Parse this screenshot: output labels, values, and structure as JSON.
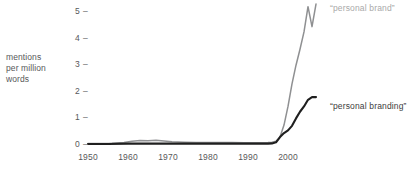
{
  "chart_data": {
    "type": "line",
    "title": "",
    "subtitle": "",
    "xlabel": "",
    "ylabel": "mentions per million words",
    "ylabel_lines": [
      "mentions",
      "per million",
      "words"
    ],
    "xlim": [
      1950,
      2008
    ],
    "ylim": [
      0,
      5.4
    ],
    "grid": false,
    "legend_position": "inline-right-of-line-ends",
    "yticks": [
      "0",
      "1",
      "2",
      "3",
      "4",
      "5"
    ],
    "ytick_values": [
      0,
      1,
      2,
      3,
      4,
      5
    ],
    "ytick_dash": "–",
    "xticks": [
      "1950",
      "1960",
      "1970",
      "1980",
      "1990",
      "2000"
    ],
    "xtick_values": [
      1950,
      1960,
      1970,
      1980,
      1990,
      2000
    ],
    "series": [
      {
        "name": "“personal brand”",
        "color": "#8f9092",
        "x": [
          1950,
          1953,
          1956,
          1959,
          1961,
          1963,
          1965,
          1967,
          1969,
          1971,
          1974,
          1977,
          1980,
          1983,
          1986,
          1989,
          1991,
          1993,
          1995,
          1996,
          1997,
          1998,
          1999,
          2000,
          2001,
          2002,
          2003,
          2004,
          2005,
          2006,
          2007
        ],
        "values": [
          0.06,
          0.06,
          0.07,
          0.09,
          0.14,
          0.17,
          0.16,
          0.18,
          0.15,
          0.12,
          0.1,
          0.09,
          0.09,
          0.09,
          0.09,
          0.08,
          0.08,
          0.08,
          0.09,
          0.1,
          0.14,
          0.3,
          0.75,
          1.45,
          2.3,
          3.0,
          3.6,
          4.25,
          5.2,
          4.45,
          5.3
        ]
      },
      {
        "name": "“personal branding”",
        "color": "#1f1f1f",
        "x": [
          1950,
          1955,
          1960,
          1965,
          1970,
          1975,
          1980,
          1985,
          1990,
          1993,
          1995,
          1996,
          1997,
          1998,
          1999,
          2000,
          2001,
          2002,
          2003,
          2004,
          2005,
          2006,
          2007
        ],
        "values": [
          0.04,
          0.04,
          0.05,
          0.05,
          0.05,
          0.05,
          0.05,
          0.05,
          0.05,
          0.05,
          0.05,
          0.06,
          0.1,
          0.3,
          0.45,
          0.55,
          0.72,
          1.0,
          1.25,
          1.45,
          1.7,
          1.8,
          1.8
        ]
      }
    ],
    "annotations": [
      {
        "text": "“personal brand”",
        "color": "#a9a9a9",
        "near_series": "personal brand"
      },
      {
        "text": "“personal branding”",
        "color": "#3c3c3c",
        "near_series": "personal branding"
      }
    ]
  },
  "axis": {
    "y_label_line1": "mentions",
    "y_label_line2": "per million",
    "y_label_line3": "words"
  },
  "yticks": [
    {
      "label": "5",
      "dash": "–"
    },
    {
      "label": "4",
      "dash": "–"
    },
    {
      "label": "3",
      "dash": "–"
    },
    {
      "label": "2",
      "dash": "–"
    },
    {
      "label": "1",
      "dash": "–"
    },
    {
      "label": "0",
      "dash": "–"
    }
  ],
  "xticks": [
    {
      "label": "1950"
    },
    {
      "label": "1960"
    },
    {
      "label": "1970"
    },
    {
      "label": "1980"
    },
    {
      "label": "1990"
    },
    {
      "label": "2000"
    }
  ],
  "labels": {
    "brand": "“personal brand”",
    "branding": "“personal branding”"
  }
}
